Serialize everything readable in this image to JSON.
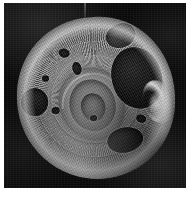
{
  "figure": {
    "kind": "sem-micrograph",
    "description": "Grayscale scanning electron micrograph of a disc-shaped microfossil with concentric striated ribbing, a central spiral chamber and several rounded perforations, one large aperture on the right rim with a bright charged highlight.",
    "background_color": "#0b0b0b",
    "page_color": "#ffffff",
    "specimen_color": "#8b8b8b",
    "highlight_color": "#ffffff",
    "shadow_color": "#050505",
    "width_px": 196,
    "height_px": 204,
    "plate": {
      "left_px": 4,
      "top_px": 3,
      "width_px": 182,
      "height_px": 185
    },
    "features": [
      {
        "name": "concentric-striated-ribbing",
        "location": "around specimen periphery"
      },
      {
        "name": "central-spiral-chamber",
        "location": "center"
      },
      {
        "name": "large-aperture",
        "location": "right"
      },
      {
        "name": "bright-charge-highlight",
        "location": "lower right rim of large aperture"
      },
      {
        "name": "left-perforation",
        "location": "left"
      },
      {
        "name": "upper-right-pit",
        "location": "upper right"
      },
      {
        "name": "lower-right-perforation",
        "location": "lower right"
      },
      {
        "name": "vertical-scan-streak",
        "location": "top center"
      }
    ]
  }
}
